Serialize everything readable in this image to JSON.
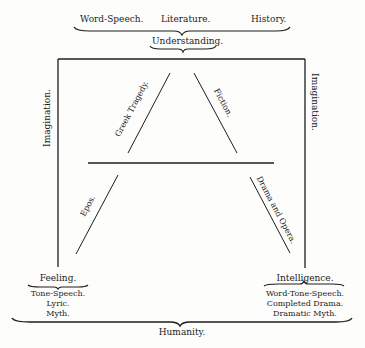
{
  "diagram": {
    "top": {
      "labels": [
        "Word-Speech.",
        "Literature.",
        "History."
      ],
      "brace_label": "Understanding."
    },
    "sides": {
      "left": "Imagination.",
      "right": "Imagination."
    },
    "triangle": {
      "upper_left": "Greek Tragedy.",
      "upper_right": "Fiction."
    },
    "lower": {
      "left": "Epos.",
      "right": "Drama and Opera."
    },
    "bottom_left": {
      "heading": "Feeling.",
      "items": [
        "Tone-Speech.",
        "Lyric.",
        "Myth."
      ]
    },
    "bottom_right": {
      "heading": "Intelligence.",
      "items": [
        "Word-Tone-Speech.",
        "Completed Drama.",
        "Dramatic Myth."
      ]
    },
    "bottom": {
      "brace_label": "Humanity."
    }
  }
}
